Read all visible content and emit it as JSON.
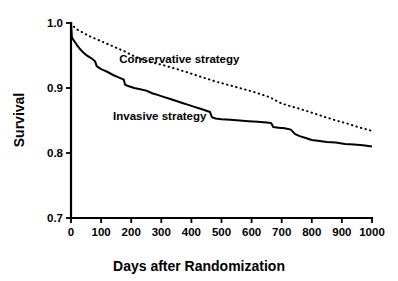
{
  "chart_data": {
    "type": "line",
    "title": "",
    "subtitle": "",
    "xlabel": "Days after Randomization",
    "ylabel": "Survival",
    "xlim": [
      0,
      1000
    ],
    "ylim": [
      0.7,
      1.0
    ],
    "grid": false,
    "legend_position": "inline-annotations",
    "xticks": [
      0,
      100,
      200,
      300,
      400,
      500,
      600,
      700,
      800,
      900,
      1000
    ],
    "xticklabels": [
      "0",
      "100",
      "200",
      "300",
      "400",
      "500",
      "600",
      "700",
      "800",
      "900",
      "1000"
    ],
    "yticks": [
      0.7,
      0.8,
      0.9,
      1.0
    ],
    "yticklabels": [
      "0.7",
      "0.8",
      "0.9",
      "1.0"
    ],
    "annotations": [
      {
        "text": "Conservative strategy",
        "x": 360,
        "y": 0.945
      },
      {
        "text": "Invasive strategy",
        "x": 295,
        "y": 0.857
      }
    ],
    "series": [
      {
        "name": "Conservative strategy",
        "style": "dotted",
        "color": "#000000",
        "x": [
          0,
          10,
          20,
          40,
          60,
          80,
          100,
          120,
          140,
          160,
          180,
          200,
          220,
          240,
          260,
          280,
          300,
          330,
          360,
          400,
          440,
          480,
          520,
          560,
          600,
          640,
          660,
          680,
          700,
          730,
          760,
          800,
          840,
          880,
          920,
          960,
          1000
        ],
        "y": [
          1.0,
          0.994,
          0.99,
          0.985,
          0.98,
          0.976,
          0.972,
          0.968,
          0.964,
          0.96,
          0.956,
          0.951,
          0.947,
          0.943,
          0.94,
          0.938,
          0.936,
          0.932,
          0.928,
          0.922,
          0.916,
          0.91,
          0.905,
          0.9,
          0.895,
          0.889,
          0.886,
          0.881,
          0.876,
          0.872,
          0.868,
          0.862,
          0.856,
          0.85,
          0.845,
          0.839,
          0.834
        ]
      },
      {
        "name": "Invasive strategy",
        "style": "solid",
        "color": "#000000",
        "x": [
          0,
          3,
          8,
          14,
          20,
          30,
          40,
          50,
          60,
          70,
          80,
          85,
          90,
          100,
          110,
          120,
          140,
          160,
          175,
          180,
          190,
          210,
          230,
          250,
          270,
          290,
          310,
          330,
          350,
          370,
          390,
          410,
          430,
          450,
          462,
          468,
          480,
          500,
          530,
          560,
          590,
          620,
          650,
          665,
          672,
          690,
          710,
          730,
          745,
          760,
          780,
          800,
          820,
          850,
          880,
          910,
          940,
          970,
          1000
        ],
        "y": [
          1.0,
          0.978,
          0.974,
          0.97,
          0.966,
          0.96,
          0.955,
          0.951,
          0.948,
          0.945,
          0.941,
          0.934,
          0.932,
          0.929,
          0.927,
          0.925,
          0.92,
          0.916,
          0.913,
          0.905,
          0.903,
          0.9,
          0.898,
          0.896,
          0.892,
          0.889,
          0.886,
          0.883,
          0.88,
          0.877,
          0.874,
          0.871,
          0.868,
          0.865,
          0.863,
          0.855,
          0.853,
          0.852,
          0.851,
          0.85,
          0.849,
          0.848,
          0.847,
          0.846,
          0.84,
          0.839,
          0.838,
          0.836,
          0.829,
          0.826,
          0.823,
          0.82,
          0.819,
          0.817,
          0.816,
          0.814,
          0.813,
          0.812,
          0.81
        ]
      }
    ]
  }
}
